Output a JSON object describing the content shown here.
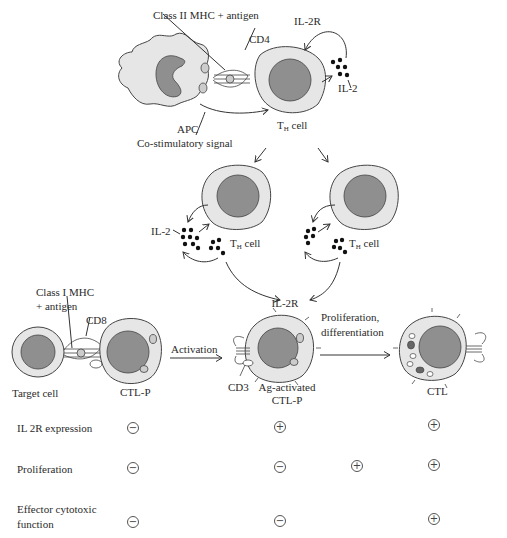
{
  "diagram": {
    "labels": {
      "class2_mhc": "Class II MHC + antigen",
      "cd4": "CD4",
      "il2r_top": "IL-2R",
      "il2_top": "IL-2",
      "apc": "APC",
      "th_cell_top": "T",
      "th_cell_top_sub": "H",
      "th_cell_top_suffix": " cell",
      "costim": "Co-stimulatory signal",
      "il2_left": "IL-2",
      "th_left": "T",
      "th_left_sub": "H",
      "th_left_suffix": " cell",
      "th_right": "T",
      "th_right_sub": "H",
      "th_right_suffix": " cell",
      "il2r_mid": "IL-2R",
      "class1_mhc_line1": "Class I MHC",
      "class1_mhc_line2": "+ antigen",
      "cd8": "CD8",
      "activation": "Activation",
      "prolif_line1": "Proliferation,",
      "prolif_line2": "differentiation",
      "target_cell": "Target cell",
      "ctlp": "CTL-P",
      "cd3": "CD3",
      "ag_activated_line1": "Ag-activated",
      "ag_activated_line2": "CTL-P",
      "ctl": "CTL"
    },
    "colors": {
      "cytoplasm": "#e6e6e6",
      "nucleus": "#8f8f8f",
      "outline": "#3a3a3a",
      "dots": "#111111"
    }
  },
  "table": {
    "rows": [
      {
        "label": "IL 2R expression",
        "values": [
          "−",
          "+",
          "",
          "+"
        ]
      },
      {
        "label": "Proliferation",
        "values": [
          "−",
          "−",
          "+",
          "+"
        ]
      },
      {
        "label_line1": "Effector cytotoxic",
        "label_line2": "function",
        "values": [
          "−",
          "−",
          "",
          "+"
        ]
      }
    ]
  }
}
